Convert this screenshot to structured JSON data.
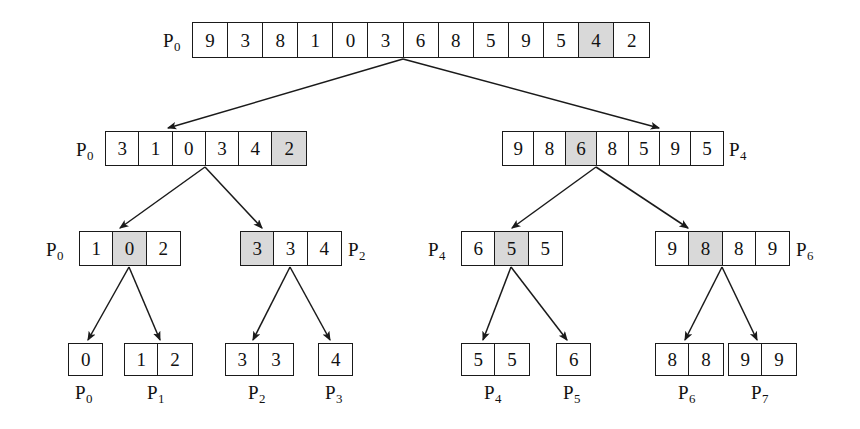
{
  "diagram": {
    "colors": {
      "background": "#ffffff",
      "stroke": "#1a1a1a",
      "text": "#111111",
      "highlight": "#d9d9d9"
    },
    "levels": [
      {
        "level": 0,
        "nodes": [
          {
            "id": "root",
            "label": "P",
            "label_sub": "0",
            "label_side": "left",
            "values": [
              "9",
              "3",
              "8",
              "1",
              "0",
              "3",
              "6",
              "8",
              "5",
              "9",
              "5",
              "4",
              "2"
            ],
            "highlight_index": 11,
            "x": 192,
            "y": 22,
            "cell_w": 35.1,
            "h": 36,
            "font_size": 19,
            "label_x": 163,
            "label_y": 31,
            "label_font_size": 19
          }
        ]
      },
      {
        "level": 1,
        "nodes": [
          {
            "id": "L1-left",
            "label": "P",
            "label_sub": "0",
            "label_side": "left",
            "values": [
              "3",
              "1",
              "0",
              "3",
              "4",
              "2"
            ],
            "highlight_index": 5,
            "x": 105,
            "y": 131,
            "cell_w": 33.3,
            "h": 35,
            "font_size": 19,
            "label_x": 76,
            "label_y": 140,
            "label_font_size": 19
          },
          {
            "id": "L1-right",
            "label": "P",
            "label_sub": "4",
            "label_side": "right",
            "values": [
              "9",
              "8",
              "6",
              "8",
              "5",
              "9",
              "5"
            ],
            "highlight_index": 2,
            "x": 502,
            "y": 131,
            "cell_w": 31.4,
            "h": 35,
            "font_size": 19,
            "label_x": 729,
            "label_y": 140,
            "label_font_size": 19
          }
        ]
      },
      {
        "level": 2,
        "nodes": [
          {
            "id": "L2-a",
            "label": "P",
            "label_sub": "0",
            "label_side": "left",
            "values": [
              "1",
              "0",
              "2"
            ],
            "highlight_index": 1,
            "x": 79,
            "y": 231,
            "cell_w": 33.3,
            "h": 35,
            "font_size": 19,
            "label_x": 46,
            "label_y": 240,
            "label_font_size": 19
          },
          {
            "id": "L2-b",
            "label": "P",
            "label_sub": "2",
            "label_side": "right",
            "values": [
              "3",
              "3",
              "4"
            ],
            "highlight_index": 0,
            "x": 240,
            "y": 231,
            "cell_w": 33.3,
            "h": 35,
            "font_size": 19,
            "label_x": 348,
            "label_y": 240,
            "label_font_size": 19
          },
          {
            "id": "L2-c",
            "label": "P",
            "label_sub": "4",
            "label_side": "left",
            "values": [
              "6",
              "5",
              "5"
            ],
            "highlight_index": 1,
            "x": 461,
            "y": 231,
            "cell_w": 33.3,
            "h": 35,
            "font_size": 19,
            "label_x": 428,
            "label_y": 240,
            "label_font_size": 19
          },
          {
            "id": "L2-d",
            "label": "P",
            "label_sub": "6",
            "label_side": "right",
            "values": [
              "9",
              "8",
              "8",
              "9"
            ],
            "highlight_index": 1,
            "x": 655,
            "y": 231,
            "cell_w": 33.3,
            "h": 35,
            "font_size": 19,
            "label_x": 796,
            "label_y": 240,
            "label_font_size": 19
          }
        ]
      },
      {
        "level": 3,
        "nodes": [
          {
            "id": "leaf-0",
            "label": "P",
            "label_sub": "0",
            "label_side": "below",
            "values": [
              "0"
            ],
            "highlight_index": -1,
            "x": 68,
            "y": 343,
            "cell_w": 33.3,
            "h": 33,
            "font_size": 19,
            "label_x": 75,
            "label_y": 383,
            "label_font_size": 19
          },
          {
            "id": "leaf-1",
            "label": "P",
            "label_sub": "1",
            "label_side": "below",
            "values": [
              "1",
              "2"
            ],
            "highlight_index": -1,
            "x": 124,
            "y": 343,
            "cell_w": 33.3,
            "h": 33,
            "font_size": 19,
            "label_x": 147,
            "label_y": 383,
            "label_font_size": 19
          },
          {
            "id": "leaf-2",
            "label": "P",
            "label_sub": "2",
            "label_side": "below",
            "values": [
              "3",
              "3"
            ],
            "highlight_index": -1,
            "x": 225,
            "y": 343,
            "cell_w": 33.3,
            "h": 33,
            "font_size": 19,
            "label_x": 248,
            "label_y": 383,
            "label_font_size": 19
          },
          {
            "id": "leaf-3",
            "label": "P",
            "label_sub": "3",
            "label_side": "below",
            "values": [
              "4"
            ],
            "highlight_index": -1,
            "x": 318,
            "y": 343,
            "cell_w": 33.3,
            "h": 33,
            "font_size": 19,
            "label_x": 325,
            "label_y": 383,
            "label_font_size": 19
          },
          {
            "id": "leaf-4",
            "label": "P",
            "label_sub": "4",
            "label_side": "below",
            "values": [
              "5",
              "5"
            ],
            "highlight_index": -1,
            "x": 461,
            "y": 343,
            "cell_w": 33.3,
            "h": 33,
            "font_size": 19,
            "label_x": 484,
            "label_y": 383,
            "label_font_size": 19
          },
          {
            "id": "leaf-5",
            "label": "P",
            "label_sub": "5",
            "label_side": "below",
            "values": [
              "6"
            ],
            "highlight_index": -1,
            "x": 556,
            "y": 343,
            "cell_w": 33.3,
            "h": 33,
            "font_size": 19,
            "label_x": 563,
            "label_y": 383,
            "label_font_size": 19
          },
          {
            "id": "leaf-6",
            "label": "P",
            "label_sub": "6",
            "label_side": "below",
            "values": [
              "8",
              "8"
            ],
            "highlight_index": -1,
            "x": 655,
            "y": 343,
            "cell_w": 33.3,
            "h": 33,
            "font_size": 19,
            "label_x": 678,
            "label_y": 383,
            "label_font_size": 19
          },
          {
            "id": "leaf-7",
            "label": "P",
            "label_sub": "7",
            "label_side": "below",
            "values": [
              "9",
              "9"
            ],
            "highlight_index": -1,
            "x": 728,
            "y": 343,
            "cell_w": 33.3,
            "h": 33,
            "font_size": 19,
            "label_x": 751,
            "label_y": 383,
            "label_font_size": 19
          }
        ]
      }
    ],
    "edges": [
      {
        "from": "root",
        "to": "L1-left",
        "x1": 403,
        "y1": 59,
        "x2": 168,
        "y2": 128
      },
      {
        "from": "root",
        "to": "L1-right",
        "x1": 403,
        "y1": 59,
        "x2": 659,
        "y2": 128
      },
      {
        "from": "L1-left",
        "to": "L2-a",
        "x1": 205,
        "y1": 167,
        "x2": 120,
        "y2": 228
      },
      {
        "from": "L1-left",
        "to": "L2-b",
        "x1": 205,
        "y1": 167,
        "x2": 262,
        "y2": 228
      },
      {
        "from": "L1-right",
        "to": "L2-c",
        "x1": 596,
        "y1": 167,
        "x2": 512,
        "y2": 228
      },
      {
        "from": "L1-right",
        "to": "L2-d",
        "x1": 596,
        "y1": 167,
        "x2": 688,
        "y2": 228
      },
      {
        "from": "L2-a",
        "to": "leaf-0",
        "x1": 129,
        "y1": 267,
        "x2": 88,
        "y2": 340
      },
      {
        "from": "L2-a",
        "to": "leaf-1",
        "x1": 129,
        "y1": 267,
        "x2": 160,
        "y2": 340
      },
      {
        "from": "L2-b",
        "to": "leaf-2",
        "x1": 290,
        "y1": 267,
        "x2": 253,
        "y2": 340
      },
      {
        "from": "L2-b",
        "to": "leaf-3",
        "x1": 290,
        "y1": 267,
        "x2": 330,
        "y2": 340
      },
      {
        "from": "L2-c",
        "to": "leaf-4",
        "x1": 511,
        "y1": 267,
        "x2": 483,
        "y2": 340
      },
      {
        "from": "L2-c",
        "to": "leaf-5",
        "x1": 511,
        "y1": 267,
        "x2": 567,
        "y2": 340
      },
      {
        "from": "L2-d",
        "to": "leaf-6",
        "x1": 722,
        "y1": 267,
        "x2": 685,
        "y2": 340
      },
      {
        "from": "L2-d",
        "to": "leaf-7",
        "x1": 722,
        "y1": 267,
        "x2": 757,
        "y2": 340
      }
    ]
  }
}
